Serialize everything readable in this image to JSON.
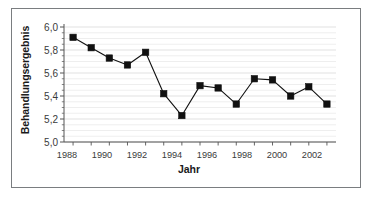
{
  "chart_data": {
    "type": "line",
    "title": "",
    "xlabel": "Jahr",
    "ylabel": "Behandlungsergebnis",
    "x": [
      1988,
      1989,
      1990,
      1991,
      1992,
      1993,
      1994,
      1995,
      1996,
      1997,
      1998,
      1999,
      2000,
      2001,
      2002
    ],
    "values": [
      5.91,
      5.82,
      5.73,
      5.67,
      5.78,
      5.42,
      5.23,
      5.49,
      5.47,
      5.33,
      5.55,
      5.54,
      5.4,
      5.48,
      5.33
    ],
    "xlim": [
      1987.5,
      2002.5
    ],
    "ylim": [
      5.0,
      6.0
    ],
    "xticks": [
      1988,
      1989,
      1990,
      1991,
      1992,
      1993,
      1994,
      1995,
      1996,
      1997,
      1998,
      1999,
      2000,
      2001,
      2002
    ],
    "xtick_labels_shown": [
      "1988",
      "1990",
      "1992",
      "1994",
      "1996",
      "1998",
      "2000",
      "2002"
    ],
    "yticks": [
      5.0,
      5.2,
      5.4,
      5.6,
      5.8,
      6.0
    ],
    "ytick_labels": [
      "5,0",
      "5,2",
      "5,4",
      "5,6",
      "5,8",
      "6,0"
    ],
    "grid": true,
    "grid_minor_step": 0.05,
    "legend": null,
    "marker": "square",
    "marker_color": "#111111",
    "line_color": "#111111",
    "grid_color": "#dcdcdc",
    "axis_color": "#555555",
    "frame_color": "#7a7d80",
    "background": "#ffffff"
  },
  "axis": {
    "y_tick_0": "5,0",
    "y_tick_1": "5,2",
    "y_tick_2": "5,4",
    "y_tick_3": "5,6",
    "y_tick_4": "5,8",
    "y_tick_5": "6,0",
    "x_tick_0": "1988",
    "x_tick_1": "1990",
    "x_tick_2": "1992",
    "x_tick_3": "1994",
    "x_tick_4": "1996",
    "x_tick_5": "1998",
    "x_tick_6": "2000",
    "x_tick_7": "2002"
  }
}
